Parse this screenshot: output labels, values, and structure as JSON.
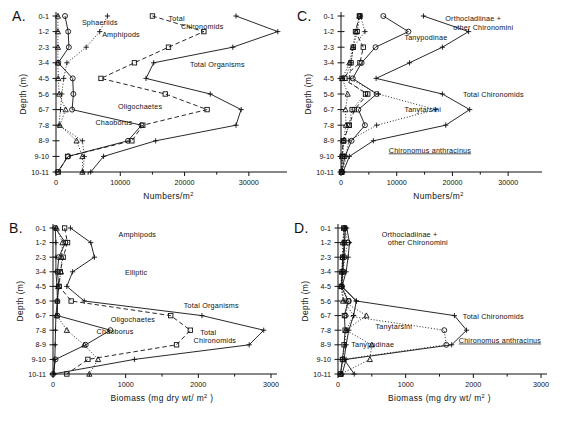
{
  "figure": {
    "depth_categories": [
      "0-1",
      "1-2",
      "2-3",
      "3-4",
      "4-5",
      "5-6",
      "6-7",
      "7-8",
      "8-9",
      "9-10",
      "10-11"
    ],
    "y_axis_label": "Depth (m)",
    "numbers_axis_label": "Numbers/m",
    "numbers_axis_sup": "2",
    "biomass_axis_label": "Biomass  (mg  dry  wt/ m",
    "biomass_axis_sup": "2",
    "biomass_axis_tail": " )"
  },
  "panels": [
    {
      "id": "A",
      "letter": "A.",
      "xlabel_kind": "numbers",
      "xlim": [
        0,
        35000
      ],
      "xticks": [
        0,
        10000,
        20000,
        30000
      ],
      "xtick_labels": [
        "0",
        "10000",
        "20000",
        "30000"
      ],
      "xminor": [
        5000,
        15000,
        25000
      ],
      "annotations": [
        {
          "name": "sphaeriids",
          "text": "Sphaeriids",
          "x": 0.115,
          "y": 0.055,
          "underline": false
        },
        {
          "name": "amphipods",
          "text": "Amphipods",
          "x": 0.205,
          "y": 0.135,
          "underline": false
        },
        {
          "name": "total-chironomids-1",
          "text": "Total",
          "x": 0.5,
          "y": 0.035,
          "underline": false
        },
        {
          "name": "total-chironomids-2",
          "text": "Chironomids",
          "x": 0.555,
          "y": 0.085,
          "underline": false
        },
        {
          "name": "total-organisms",
          "text": "Total  Organisms",
          "x": 0.595,
          "y": 0.33,
          "underline": false
        },
        {
          "name": "oligochaetes",
          "text": "Oligochaetes",
          "x": 0.275,
          "y": 0.595,
          "underline": false
        },
        {
          "name": "chaoborus",
          "text": "Chaoborus",
          "x": 0.175,
          "y": 0.7,
          "underline": false
        }
      ]
    },
    {
      "id": "C",
      "letter": "C.",
      "xlabel_kind": "numbers",
      "xlim": [
        0,
        35000
      ],
      "xticks": [
        0,
        10000,
        20000,
        30000
      ],
      "xtick_labels": [
        "0",
        "10000",
        "20000",
        "30000"
      ],
      "xminor": [
        5000,
        15000,
        25000
      ],
      "annotations": [
        {
          "name": "orthocladiinae",
          "text": "Orthocladiinae  +",
          "x": 0.535,
          "y": 0.035,
          "underline": false
        },
        {
          "name": "other-chironomini",
          "text": "other  Chironomini",
          "x": 0.575,
          "y": 0.09,
          "underline": false
        },
        {
          "name": "tanypodinae",
          "text": "Tanypodinae",
          "x": 0.325,
          "y": 0.155,
          "underline": false
        },
        {
          "name": "total-chironomids",
          "text": "Total  Chironomids",
          "x": 0.625,
          "y": 0.52,
          "underline": false
        },
        {
          "name": "tanytarsini",
          "text": "Tanytarsini",
          "x": 0.325,
          "y": 0.615,
          "underline": false
        },
        {
          "name": "chironomus-anthracinus",
          "text": "Chironomus   anthracinus",
          "x": 0.245,
          "y": 0.875,
          "underline": true
        }
      ]
    },
    {
      "id": "B",
      "letter": "B.",
      "xlabel_kind": "biomass",
      "xlim": [
        0,
        3000
      ],
      "xticks": [
        0,
        1000,
        2000,
        3000
      ],
      "xtick_labels": [
        "0",
        "1000",
        "2000",
        "3000"
      ],
      "xminor": [
        500,
        1500,
        2500
      ],
      "annotations": [
        {
          "name": "amphipods",
          "text": "Amphipods",
          "x": 0.3,
          "y": 0.065,
          "underline": false
        },
        {
          "name": "elliptic",
          "text": "Elliptic",
          "x": 0.33,
          "y": 0.325,
          "underline": false
        },
        {
          "name": "total-organisms",
          "text": "Total  Organisms",
          "x": 0.6,
          "y": 0.545,
          "underline": false
        },
        {
          "name": "oligochaetes",
          "text": "Oligochaetes",
          "x": 0.265,
          "y": 0.645,
          "underline": false
        },
        {
          "name": "chaoborus",
          "text": "Chaoborus",
          "x": 0.2,
          "y": 0.725,
          "underline": false
        },
        {
          "name": "total-chironomids-1",
          "text": "Total",
          "x": 0.675,
          "y": 0.735,
          "underline": false
        },
        {
          "name": "total-chironomids-2",
          "text": "Chironomids",
          "x": 0.645,
          "y": 0.785,
          "underline": false
        }
      ]
    },
    {
      "id": "D",
      "letter": "D.",
      "xlabel_kind": "biomass",
      "xlim": [
        0,
        3000
      ],
      "xticks": [
        0,
        1000,
        2000,
        3000
      ],
      "xtick_labels": [
        "0",
        "1000",
        "2000",
        "3000"
      ],
      "xminor": [
        500,
        1500,
        2500
      ],
      "annotations": [
        {
          "name": "orthocladiinae",
          "text": "Orthocladiinae  +",
          "x": 0.215,
          "y": 0.065,
          "underline": false
        },
        {
          "name": "other-chironomini",
          "text": "other  Chironomini",
          "x": 0.245,
          "y": 0.115,
          "underline": false
        },
        {
          "name": "total-chironomids",
          "text": "Total  Chironomids",
          "x": 0.615,
          "y": 0.625,
          "underline": false
        },
        {
          "name": "tanytarsini",
          "text": "Tanytarsini",
          "x": 0.185,
          "y": 0.695,
          "underline": false
        },
        {
          "name": "tanypodinae",
          "text": "Tanypodinae",
          "x": 0.065,
          "y": 0.815,
          "underline": false
        },
        {
          "name": "chironomus-anthracinus",
          "text": "Chironomus  anthracinus",
          "x": 0.595,
          "y": 0.785,
          "underline": true
        }
      ]
    }
  ],
  "chart_data": [
    {
      "panel": "A",
      "type": "line",
      "title": "A.",
      "xlabel": "Numbers/m2",
      "ylabel": "Depth (m)",
      "xlim": [
        0,
        35000
      ],
      "ylim_categories": [
        "0-1",
        "1-2",
        "2-3",
        "3-4",
        "4-5",
        "5-6",
        "6-7",
        "7-8",
        "8-9",
        "9-10",
        "10-11"
      ],
      "grid": false,
      "legend": "inline-annotations",
      "series": [
        {
          "name": "Sphaeriids",
          "marker": "circle",
          "line": "solid",
          "values": [
            1400,
            1900,
            2000,
            350,
            2600,
            2700,
            2500,
            13300,
            11200,
            1900,
            250
          ]
        },
        {
          "name": "Amphipods",
          "marker": "plus",
          "line": "dotted",
          "values": [
            8000,
            6800,
            4700,
            1700,
            1200,
            900,
            700,
            450,
            4100,
            4400,
            4200
          ]
        },
        {
          "name": "Total Chironomids",
          "marker": "square",
          "line": "dashed",
          "values": [
            15000,
            23000,
            17500,
            12200,
            7000,
            17000,
            23500,
            13500,
            11800,
            1800,
            350
          ]
        },
        {
          "name": "Total Organisms",
          "marker": "plus",
          "line": "solid",
          "values": [
            28000,
            34500,
            27500,
            15200,
            14000,
            24000,
            28800,
            28000,
            15500,
            7400,
            5400
          ]
        },
        {
          "name": "Chaoborus",
          "marker": "triangle",
          "line": "dotted",
          "values": [
            300,
            300,
            300,
            300,
            350,
            500,
            1500,
            600,
            3200,
            4100,
            4100
          ]
        }
      ]
    },
    {
      "panel": "C",
      "type": "line",
      "title": "C.",
      "xlabel": "Numbers/m2",
      "ylabel": "Depth (m)",
      "xlim": [
        0,
        35000
      ],
      "ylim_categories": [
        "0-1",
        "1-2",
        "2-3",
        "3-4",
        "4-5",
        "5-6",
        "6-7",
        "7-8",
        "8-9",
        "9-10",
        "10-11"
      ],
      "grid": false,
      "legend": "inline-annotations",
      "series": [
        {
          "name": "Orthocladiinae + other Chironomini",
          "marker": "square",
          "line": "dotted",
          "values": [
            3400,
            2900,
            2200,
            1800,
            700,
            4400,
            2000,
            1400,
            500,
            300,
            100
          ]
        },
        {
          "name": "Tanypodinae",
          "marker": "circle",
          "line": "solid",
          "values": [
            7600,
            12100,
            6200,
            3700,
            2100,
            6400,
            3100,
            4300,
            1900,
            700,
            150
          ]
        },
        {
          "name": "Chironomus anthracinus",
          "marker": "square",
          "line": "dashed",
          "values": [
            3300,
            2600,
            4000,
            3400,
            200,
            4800,
            2400,
            1500,
            400,
            200,
            100
          ]
        },
        {
          "name": "Tanytarsini",
          "marker": "plus",
          "line": "dotted",
          "values": [
            3500,
            4300,
            2200,
            1800,
            1500,
            6700,
            17000,
            6400,
            1400,
            900,
            300
          ]
        },
        {
          "name": "Total Chironomids",
          "marker": "plus",
          "line": "solid",
          "values": [
            14800,
            22900,
            18200,
            12300,
            6300,
            18200,
            23100,
            18800,
            5800,
            1500,
            350
          ]
        },
        {
          "name": "Tanypodinae-b",
          "marker": "triangle",
          "line": "dotted",
          "values": [
            3300,
            2700,
            2100,
            1500,
            250,
            1200,
            800,
            900,
            400,
            200,
            100
          ]
        }
      ]
    },
    {
      "panel": "B",
      "type": "line",
      "title": "B.",
      "xlabel": "Biomass (mg dry wt/m2)",
      "ylabel": "Depth (m)",
      "xlim": [
        0,
        3000
      ],
      "ylim_categories": [
        "0-1",
        "1-2",
        "2-3",
        "3-4",
        "4-5",
        "5-6",
        "6-7",
        "7-8",
        "8-9",
        "9-10",
        "10-11"
      ],
      "grid": false,
      "legend": "inline-annotations",
      "series": [
        {
          "name": "Amphipods",
          "marker": "plus",
          "line": "solid",
          "values": [
            240,
            520,
            570,
            270,
            190,
            430,
            2050,
            2900,
            2700,
            1120,
            0
          ]
        },
        {
          "name": "Elliptic",
          "marker": "circle",
          "line": "solid",
          "values": [
            30,
            170,
            80,
            60,
            80,
            60,
            60,
            790,
            450,
            35,
            0
          ]
        },
        {
          "name": "Oligochaetes",
          "marker": "square",
          "line": "dashed",
          "values": [
            160,
            200,
            140,
            100,
            85,
            250,
            1620,
            1890,
            1700,
            480,
            190
          ]
        },
        {
          "name": "Chaoborus",
          "marker": "triangle",
          "line": "dotted",
          "values": [
            50,
            130,
            120,
            110,
            70,
            60,
            55,
            190,
            430,
            620,
            500
          ]
        },
        {
          "name": "Total Organisms",
          "marker": "plus",
          "line": "solid",
          "values": [
            30,
            40,
            40,
            40,
            55,
            60,
            40,
            35,
            30,
            25,
            15
          ]
        }
      ]
    },
    {
      "panel": "D",
      "type": "line",
      "title": "D.",
      "xlabel": "Biomass (mg dry wt/m2)",
      "ylabel": "Depth (m)",
      "xlim": [
        0,
        3000
      ],
      "ylim_categories": [
        "0-1",
        "1-2",
        "2-3",
        "3-4",
        "4-5",
        "5-6",
        "6-7",
        "7-8",
        "8-9",
        "9-10",
        "10-11"
      ],
      "grid": false,
      "legend": "inline-annotations",
      "series": [
        {
          "name": "Orthocladiinae + other Chironomini",
          "marker": "plus",
          "line": "solid",
          "values": [
            130,
            170,
            150,
            120,
            60,
            270,
            230,
            160,
            120,
            90,
            240
          ]
        },
        {
          "name": "Total Chironomids",
          "marker": "plus",
          "line": "solid",
          "values": [
            110,
            100,
            90,
            70,
            55,
            270,
            1720,
            1900,
            1680,
            120,
            60
          ]
        },
        {
          "name": "Tanytarsini",
          "marker": "plus",
          "line": "dotted",
          "values": [
            95,
            80,
            75,
            60,
            50,
            90,
            230,
            120,
            100,
            70,
            40
          ]
        },
        {
          "name": "Chironomus anthracinus",
          "marker": "circle",
          "line": "dotted",
          "values": [
            100,
            150,
            95,
            80,
            60,
            160,
            110,
            1570,
            1600,
            75,
            40
          ]
        },
        {
          "name": "Tanypodinae",
          "marker": "triangle",
          "line": "dotted",
          "values": [
            90,
            70,
            65,
            55,
            45,
            75,
            420,
            115,
            500,
            470,
            45
          ]
        },
        {
          "name": "Tanypodinae-b",
          "marker": "square",
          "line": "solid",
          "values": [
            85,
            95,
            70,
            60,
            48,
            150,
            95,
            105,
            90,
            65,
            35
          ]
        }
      ]
    }
  ]
}
